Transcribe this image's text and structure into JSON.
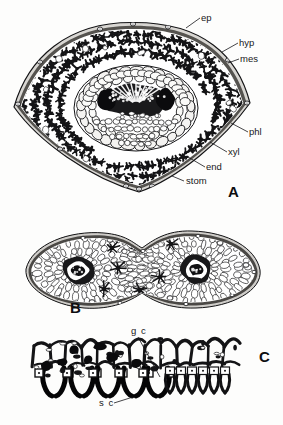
{
  "figure": {
    "kind": "botanical-micrograph-plate",
    "background_color": "#fdfdfc",
    "ink_color": "#141416",
    "panels": [
      {
        "id": "A",
        "letter": "A",
        "caption_letter_pos": {
          "x": 228,
          "y": 197
        },
        "description": "fan-shaped needle cross-section with central vascular bundle"
      },
      {
        "id": "B",
        "letter": "B",
        "caption_letter_pos": {
          "x": 70,
          "y": 313
        },
        "description": "dumbbell-shaped cross-section with two vascular bundles"
      },
      {
        "id": "C",
        "letter": "C",
        "caption_letter_pos": {
          "x": 259,
          "y": 362
        },
        "description": "epidermal strip showing sunken stomata"
      }
    ],
    "labels": [
      {
        "id": "ep",
        "text": "ep",
        "panel": "A",
        "x": 201,
        "y": 21,
        "anchor": "start",
        "leader": [
          [
            200,
            18
          ],
          [
            186,
            28
          ]
        ],
        "meaning": "epidermis"
      },
      {
        "id": "hyp",
        "text": "hyp",
        "panel": "A",
        "x": 239,
        "y": 46,
        "anchor": "start",
        "leader": [
          [
            238,
            43
          ],
          [
            222,
            52
          ]
        ],
        "meaning": "hypodermis"
      },
      {
        "id": "mes",
        "text": "mes",
        "panel": "A",
        "x": 240,
        "y": 62,
        "anchor": "start",
        "leader": [
          [
            239,
            59
          ],
          [
            228,
            63
          ]
        ],
        "meaning": "mesophyll"
      },
      {
        "id": "phl",
        "text": "phl",
        "panel": "A",
        "x": 249,
        "y": 135,
        "anchor": "start",
        "leader": [
          [
            248,
            132
          ],
          [
            231,
            123
          ]
        ],
        "meaning": "phloem"
      },
      {
        "id": "xyl",
        "text": "xyl",
        "panel": "A",
        "x": 228,
        "y": 155,
        "anchor": "start",
        "leader": [
          [
            227,
            152
          ],
          [
            210,
            142
          ]
        ],
        "meaning": "xylem"
      },
      {
        "id": "end",
        "text": "end",
        "panel": "A",
        "x": 206,
        "y": 170,
        "anchor": "start",
        "leader": [
          [
            205,
            167
          ],
          [
            188,
            157
          ]
        ],
        "meaning": "endodermis"
      },
      {
        "id": "stom",
        "text": "stom",
        "panel": "A",
        "x": 186,
        "y": 184,
        "anchor": "start",
        "leader": [
          [
            184,
            181
          ],
          [
            172,
            176
          ]
        ],
        "meaning": "stoma"
      },
      {
        "id": "gc",
        "text": "g c",
        "panel": "C",
        "x": 131,
        "y": 334,
        "anchor": "start",
        "leader": [
          [
            138,
            337
          ],
          [
            160,
            377
          ]
        ],
        "meaning": "guard cell"
      },
      {
        "id": "sc",
        "text": "s c",
        "panel": "C",
        "x": 99,
        "y": 406,
        "anchor": "start",
        "leader": [
          [
            114,
            403
          ],
          [
            133,
            397
          ]
        ],
        "meaning": "subsidiary cell"
      }
    ]
  }
}
